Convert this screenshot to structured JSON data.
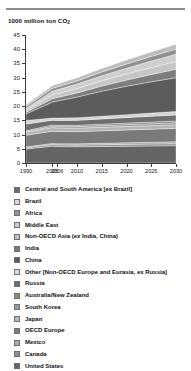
{
  "chart_data": {
    "type": "area",
    "stacked": true,
    "title": "",
    "subtitle": "",
    "ylabel": "1000 million ton CO2",
    "ylabel_display": "1000 million ton CO",
    "ylabel_sub": "2",
    "xlabel": "",
    "ylim": [
      0,
      45
    ],
    "y_ticks": [
      0,
      5,
      10,
      15,
      20,
      25,
      30,
      35,
      40,
      45
    ],
    "x": [
      1990,
      2005,
      2006,
      2010,
      2015,
      2020,
      2025,
      2030
    ],
    "x_tick_labels": [
      "1990",
      "2005",
      "2006",
      "2010",
      "2015",
      "2020",
      "2025",
      "2030"
    ],
    "grid": false,
    "legend_position": "below",
    "series": [
      {
        "name": "United States",
        "color": "#646464",
        "values": [
          4.9,
          5.9,
          5.8,
          5.7,
          5.8,
          5.9,
          6.0,
          6.1
        ]
      },
      {
        "name": "Canada",
        "color": "#8f8f8f",
        "values": [
          0.45,
          0.58,
          0.58,
          0.58,
          0.62,
          0.65,
          0.68,
          0.7
        ]
      },
      {
        "name": "Mexico",
        "color": "#a8a8a8",
        "values": [
          0.3,
          0.41,
          0.42,
          0.45,
          0.5,
          0.56,
          0.62,
          0.68
        ]
      },
      {
        "name": "OECD Europe",
        "color": "#7a7a7a",
        "values": [
          4.1,
          4.3,
          4.3,
          4.3,
          4.4,
          4.5,
          4.6,
          4.7
        ]
      },
      {
        "name": "Japan",
        "color": "#b5b5b5",
        "values": [
          1.05,
          1.25,
          1.24,
          1.22,
          1.22,
          1.22,
          1.22,
          1.22
        ]
      },
      {
        "name": "South Korea",
        "color": "#9c9c9c",
        "values": [
          0.25,
          0.5,
          0.51,
          0.55,
          0.6,
          0.65,
          0.7,
          0.74
        ]
      },
      {
        "name": "Australia/New Zealand",
        "color": "#868686",
        "values": [
          0.3,
          0.43,
          0.44,
          0.46,
          0.5,
          0.54,
          0.58,
          0.62
        ]
      },
      {
        "name": "Russia",
        "color": "#6f6f6f",
        "values": [
          2.35,
          1.65,
          1.68,
          1.75,
          1.85,
          1.95,
          2.05,
          2.15
        ]
      },
      {
        "name": "Other (Non-OECD Europe and Eurasia, ex Russia)",
        "color": "#d4d4d4",
        "values": [
          1.25,
          0.8,
          0.82,
          0.88,
          0.95,
          1.02,
          1.1,
          1.18
        ]
      },
      {
        "name": "China",
        "color": "#5c5c5c",
        "values": [
          2.25,
          5.6,
          6.0,
          7.3,
          8.8,
          10.0,
          11.0,
          11.9
        ]
      },
      {
        "name": "India",
        "color": "#7d7d7d",
        "values": [
          0.6,
          1.15,
          1.2,
          1.45,
          1.8,
          2.15,
          2.55,
          2.95
        ]
      },
      {
        "name": "Non-OECD Asia (ex India, China)",
        "color": "#c6c6c6",
        "values": [
          0.7,
          1.3,
          1.35,
          1.55,
          1.85,
          2.15,
          2.45,
          2.75
        ]
      },
      {
        "name": "Middle East",
        "color": "#cfcfcf",
        "values": [
          0.7,
          1.35,
          1.4,
          1.55,
          1.8,
          2.05,
          2.3,
          2.55
        ]
      },
      {
        "name": "Africa",
        "color": "#909090",
        "values": [
          0.65,
          1.0,
          1.02,
          1.12,
          1.28,
          1.45,
          1.62,
          1.8
        ]
      },
      {
        "name": "Central and South America [ex Brazil]",
        "color": "#bdbdbd",
        "values": [
          0.6,
          0.95,
          0.98,
          1.08,
          1.22,
          1.38,
          1.55,
          1.72
        ]
      }
    ],
    "legend_order": [
      "Central and South America [ex Brazil]",
      "Brazil",
      "Africa",
      "Middle East",
      "Non-OECD Asia (ex India, China)",
      "India",
      "China",
      "Other [Non-OECD Europe and Eurasia, ex Russia]",
      "Russia",
      "Australia/New Zealand",
      "South Korea",
      "Japan",
      "OECD Europe",
      "Mexico",
      "Canada",
      "United States"
    ]
  },
  "legend": {
    "items": [
      {
        "label": "Central and South America [ex Brazil]",
        "color": "#6d6d6d"
      },
      {
        "label": "Brazil",
        "color": "#d9d9d9"
      },
      {
        "label": "Africa",
        "color": "#949494"
      },
      {
        "label": "Middle East",
        "color": "#cfcfcf"
      },
      {
        "label": "Non-OECD Asia (ex India, China)",
        "color": "#c2c2c2"
      },
      {
        "label": "India",
        "color": "#7d7d7d"
      },
      {
        "label": "China",
        "color": "#5c5c5c"
      },
      {
        "label": "Other [Non-OECD Europe and Eurasia, ex Russia]",
        "color": "#dcdcdc"
      },
      {
        "label": "Russia",
        "color": "#6f6f6f"
      },
      {
        "label": "Australia/New Zealand",
        "color": "#8a8a8a"
      },
      {
        "label": "South Korea",
        "color": "#9c9c9c"
      },
      {
        "label": "Japan",
        "color": "#b8b8b8"
      },
      {
        "label": "OECD Europe",
        "color": "#7a7a7a"
      },
      {
        "label": "Mexico",
        "color": "#ababab"
      },
      {
        "label": "Canada",
        "color": "#8f8f8f"
      },
      {
        "label": "United States",
        "color": "#646464"
      }
    ]
  }
}
